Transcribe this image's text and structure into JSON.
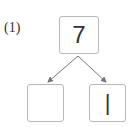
{
  "problem_label": "(1)",
  "top_value": "7",
  "bottom_left_value": "",
  "bottom_right_value": "|",
  "colors": {
    "box_border": "#b8b8b8",
    "arrow": "#777777",
    "text": "#333333"
  }
}
